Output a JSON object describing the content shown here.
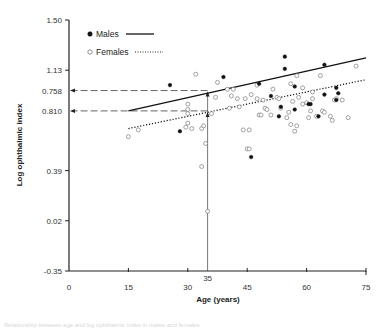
{
  "chart_data": {
    "type": "scatter",
    "title": "",
    "xlabel": "Age (years)",
    "ylabel": "Log ophthalmic index",
    "xlim": [
      0,
      75
    ],
    "ylim": [
      -0.35,
      1.5
    ],
    "x_ticks": [
      0,
      15,
      30,
      35,
      45,
      60,
      75
    ],
    "y_ticks": [
      {
        "label": "1.50",
        "value": 1.5
      },
      {
        "label": "1.13",
        "value": 1.13
      },
      {
        "label": "0.758",
        "value": 0.98
      },
      {
        "label": "0.810",
        "value": 0.83
      },
      {
        "label": "0.39",
        "value": 0.39
      },
      {
        "label": "0.02",
        "value": 0.02
      },
      {
        "label": "-0.35",
        "value": -0.35
      }
    ],
    "grid": false,
    "legend": {
      "position": "upper-left",
      "entries": [
        {
          "name": "Males",
          "marker": "filled-circle",
          "line": "solid"
        },
        {
          "name": "Females",
          "marker": "open-circle",
          "line": "dotted"
        }
      ]
    },
    "series": [
      {
        "name": "Males",
        "marker": "filled-circle",
        "points": [
          [
            25.5,
            1.02
          ],
          [
            28,
            0.68
          ],
          [
            39,
            1.08
          ],
          [
            46,
            0.49
          ],
          [
            48,
            1.03
          ],
          [
            51,
            0.94
          ],
          [
            53.5,
            0.86
          ],
          [
            54.5,
            1.23
          ],
          [
            54.5,
            1.14
          ],
          [
            57,
            1.01
          ],
          [
            60.5,
            0.88
          ],
          [
            61,
            0.88
          ],
          [
            64.5,
            1.17
          ],
          [
            64.5,
            0.95
          ],
          [
            67.5,
            1.0
          ],
          [
            67.5,
            0.91
          ],
          [
            68,
            0.96
          ],
          [
            63,
            0.79
          ],
          [
            57,
            0.84
          ],
          [
            53,
            0.79
          ]
        ],
        "regression": {
          "x": [
            15,
            75
          ],
          "y": [
            0.83,
            1.22
          ]
        }
      },
      {
        "name": "Females",
        "marker": "open-circle",
        "points": [
          [
            15,
            0.64
          ],
          [
            17.5,
            0.69
          ],
          [
            30,
            0.74
          ],
          [
            30,
            0.81
          ],
          [
            30,
            0.88
          ],
          [
            30,
            0.84
          ],
          [
            31,
            0.7
          ],
          [
            29.5,
            0.71
          ],
          [
            32,
            1.1
          ],
          [
            33.5,
            0.7
          ],
          [
            34,
            0.72
          ],
          [
            36,
            0.81
          ],
          [
            34.5,
            0.59
          ],
          [
            35,
            0.09
          ],
          [
            33.5,
            0.42
          ],
          [
            37,
            0.93
          ],
          [
            37.5,
            1.04
          ],
          [
            40,
            0.99
          ],
          [
            40.5,
            0.85
          ],
          [
            41.5,
            0.99
          ],
          [
            43,
            0.86
          ],
          [
            44,
            0.69
          ],
          [
            45,
            0.55
          ],
          [
            45.5,
            0.55
          ],
          [
            46,
            0.95
          ],
          [
            47.5,
            0.92
          ],
          [
            48,
            0.8
          ],
          [
            48.5,
            0.8
          ],
          [
            49,
            0.91
          ],
          [
            49.5,
            0.85
          ],
          [
            51,
            0.8
          ],
          [
            52.5,
            0.93
          ],
          [
            53,
            0.92
          ],
          [
            53.5,
            0.85
          ],
          [
            55,
            0.78
          ],
          [
            55.5,
            0.82
          ],
          [
            56,
            0.73
          ],
          [
            57,
            0.68
          ],
          [
            57.5,
            0.72
          ],
          [
            58,
            0.93
          ],
          [
            59,
            0.88
          ],
          [
            60,
            0.89
          ],
          [
            60.5,
            0.78
          ],
          [
            61,
            0.83
          ],
          [
            61.5,
            0.92
          ],
          [
            62.5,
            0.79
          ],
          [
            63.5,
            1.09
          ],
          [
            64,
            0.83
          ],
          [
            64.5,
            0.82
          ],
          [
            66,
            0.79
          ],
          [
            66.5,
            0.76
          ],
          [
            67,
            0.91
          ],
          [
            67.5,
            0.92
          ],
          [
            69,
            0.91
          ],
          [
            70.5,
            0.78
          ],
          [
            72.5,
            1.16
          ],
          [
            57.5,
            1.09
          ],
          [
            61.5,
            0.97
          ],
          [
            47.5,
            1.02
          ],
          [
            44.5,
            0.92
          ],
          [
            51.5,
            0.99
          ],
          [
            56,
            1.03
          ],
          [
            59,
            1.0
          ],
          [
            41,
            0.94
          ],
          [
            42.5,
            0.92
          ],
          [
            45.5,
            0.69
          ],
          [
            50,
            0.84
          ],
          [
            56.5,
            0.9
          ]
        ],
        "regression": {
          "x": [
            15,
            75
          ],
          "y": [
            0.7,
            1.06
          ]
        }
      }
    ],
    "annotations": [
      {
        "type": "dashed-arrow",
        "label": "0.758",
        "from": [
          35,
          0.98
        ],
        "to": [
          0,
          0.98
        ]
      },
      {
        "type": "dashed-arrow",
        "label": "0.810",
        "from": [
          35,
          0.83
        ],
        "to": [
          0,
          0.83
        ]
      },
      {
        "type": "vertical-line",
        "x": 35,
        "from_y": -0.35,
        "to_y": 0.98
      }
    ]
  },
  "colors": {
    "axis": "#222222",
    "male": "#111111",
    "female": "#666666",
    "annotation": "#555555"
  },
  "caption": "Relationship between age and log ophthalmic index in males and females"
}
